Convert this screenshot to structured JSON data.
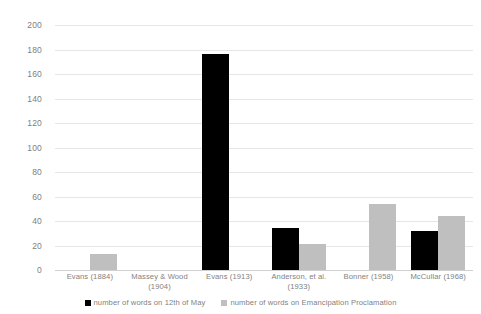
{
  "chart_data": {
    "type": "bar",
    "title": "",
    "subtitle": "",
    "xlabel": "",
    "ylabel": "",
    "ylim": [
      0,
      200
    ],
    "ytick_step": 20,
    "yticks": [
      200,
      180,
      160,
      140,
      120,
      100,
      80,
      60,
      40,
      20,
      0
    ],
    "grid": true,
    "legend_position": "bottom",
    "categories": [
      "Evans (1884)",
      "Massey & Wood (1904)",
      "Evans (1913)",
      "Anderson, et al. (1933)",
      "Bonner (1958)",
      "McCullar (1968)"
    ],
    "series": [
      {
        "name": "number of words on 12th of May",
        "color": "#000000",
        "values": [
          null,
          null,
          176,
          34,
          null,
          32
        ]
      },
      {
        "name": "number of words on Emancipation Proclamation",
        "color": "#BFBFBF",
        "values": [
          13,
          null,
          null,
          21,
          54,
          44
        ]
      }
    ]
  },
  "colors": {
    "series_0": "#000000",
    "series_1": "#BFBFBF",
    "gridline": "#E6E6E6",
    "text": "#7F7F7F",
    "background": "#FFFFFF"
  }
}
